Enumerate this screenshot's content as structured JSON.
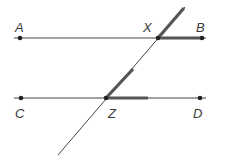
{
  "diagram": {
    "labels": {
      "A": "A",
      "B": "B",
      "C": "C",
      "D": "D",
      "X": "X",
      "Z": "Z"
    },
    "colors": {
      "line": "#444444",
      "highlight": "#555555",
      "point": "#222222",
      "background": "#ffffff"
    },
    "lines": [
      {
        "name": "AB",
        "from": [
          14,
          38
        ],
        "to": [
          206,
          38
        ]
      },
      {
        "name": "CD",
        "from": [
          14,
          98
        ],
        "to": [
          206,
          98
        ]
      },
      {
        "name": "transversal",
        "from": [
          58,
          155
        ],
        "to": [
          185,
          7
        ]
      }
    ],
    "highlighted_angles": [
      {
        "vertex": "X",
        "sides": [
          "XB",
          "X-upward-ray"
        ]
      },
      {
        "vertex": "Z",
        "sides": [
          "Z-toward-D",
          "ZX"
        ]
      }
    ]
  }
}
